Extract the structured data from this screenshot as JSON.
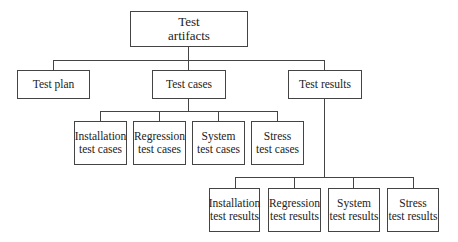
{
  "diagram": {
    "type": "tree",
    "root": {
      "line1": "Test",
      "line2": "artifacts"
    },
    "level1": [
      {
        "label": "Test plan"
      },
      {
        "label": "Test cases"
      },
      {
        "label": "Test results"
      }
    ],
    "test_cases_children": [
      {
        "line1": "Installation",
        "line2": "test cases"
      },
      {
        "line1": "Regression",
        "line2": "test cases"
      },
      {
        "line1": "System",
        "line2": "test cases"
      },
      {
        "line1": "Stress",
        "line2": "test cases"
      }
    ],
    "test_results_children": [
      {
        "line1": "Installation",
        "line2": "test results"
      },
      {
        "line1": "Regression",
        "line2": "test results"
      },
      {
        "line1": "System",
        "line2": "test results"
      },
      {
        "line1": "Stress",
        "line2": "test results"
      }
    ],
    "colors": {
      "line": "#444444",
      "background": "#ffffff",
      "text": "#222222"
    }
  }
}
